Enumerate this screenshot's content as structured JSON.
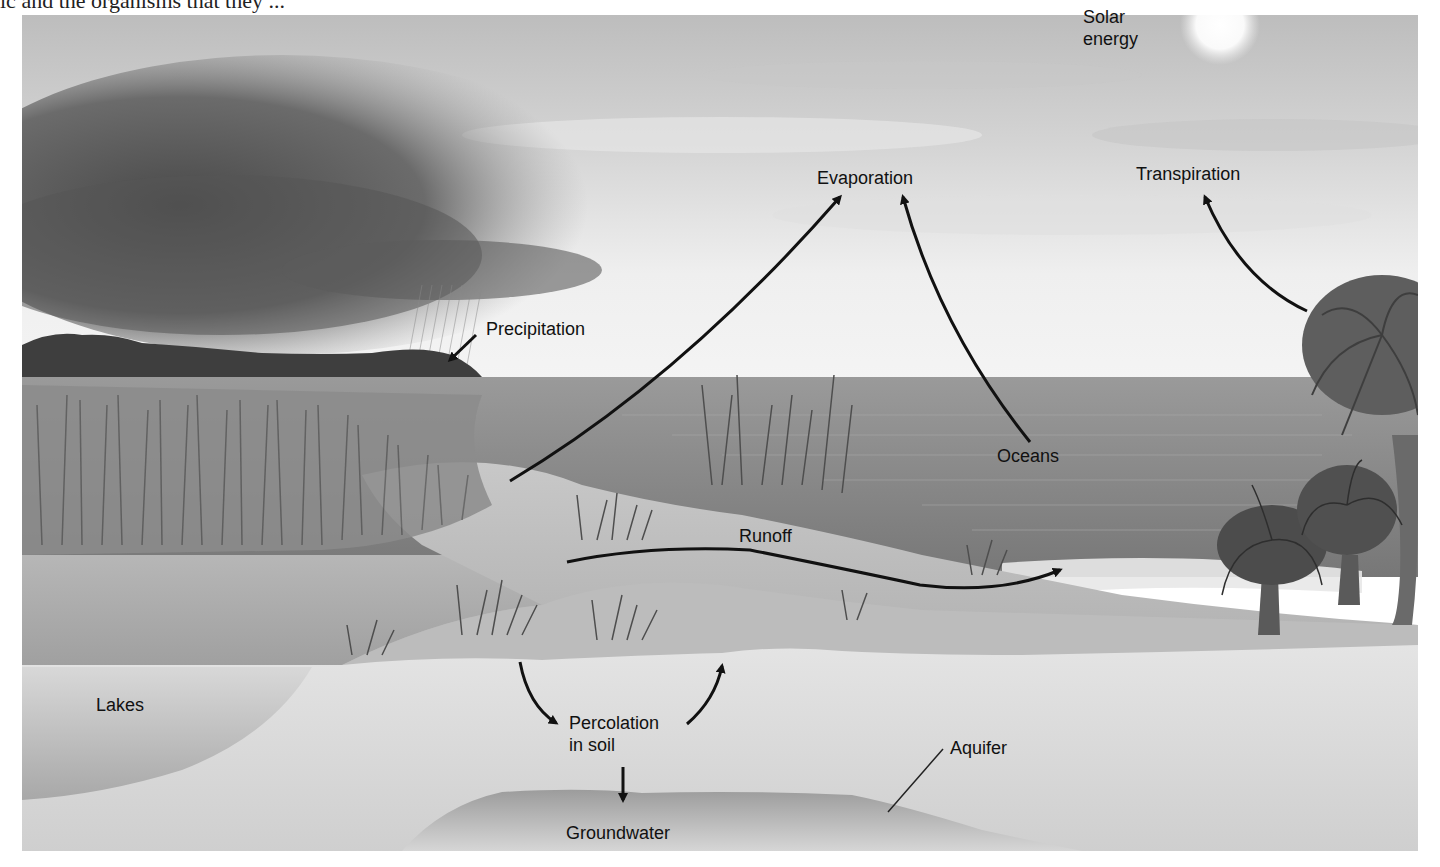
{
  "page": {
    "cropped_heading_text": "ic and the organisms that they ..."
  },
  "diagram": {
    "title": "",
    "type": "water-cycle-illustration",
    "colors": {
      "sky_light": "#eeeeee",
      "sky_mid": "#cfcfcf",
      "storm_cloud": "#5a5a5a",
      "ocean": "#8a8a8a",
      "marsh_water": "#a9a9a9",
      "sand": "#c4c4c4",
      "soil": "#dddddd",
      "groundwater": "#a4a4a4",
      "vegetation": "#555555",
      "arrow": "#111111",
      "label_text": "#111111"
    },
    "labels": {
      "solar_energy_line1": "Solar",
      "solar_energy_line2": "energy",
      "evaporation": "Evaporation",
      "transpiration": "Transpiration",
      "precipitation": "Precipitation",
      "oceans": "Oceans",
      "runoff": "Runoff",
      "lakes": "Lakes",
      "percolation_line1": "Percolation",
      "percolation_line2": "in soil",
      "aquifer": "Aquifer",
      "groundwater": "Groundwater"
    },
    "flows": [
      {
        "from": "Lakes (marsh water)",
        "to": "Evaporation",
        "kind": "arrow"
      },
      {
        "from": "Oceans",
        "to": "Evaporation",
        "kind": "arrow"
      },
      {
        "from": "Palm trees",
        "to": "Transpiration",
        "kind": "arrow"
      },
      {
        "from": "Storm cloud",
        "to": "Land",
        "kind": "Precipitation arrow"
      },
      {
        "from": "Dune surface",
        "to": "Ocean",
        "kind": "Runoff arrow"
      },
      {
        "from": "Surface",
        "to": "Percolation in soil",
        "kind": "curved arrow down"
      },
      {
        "from": "Percolation in soil",
        "to": "Surface",
        "kind": "curved arrow up"
      },
      {
        "from": "Percolation in soil",
        "to": "Groundwater",
        "kind": "straight arrow down"
      },
      {
        "from": "Aquifer label",
        "to": "Groundwater layer",
        "kind": "leader line"
      }
    ]
  }
}
